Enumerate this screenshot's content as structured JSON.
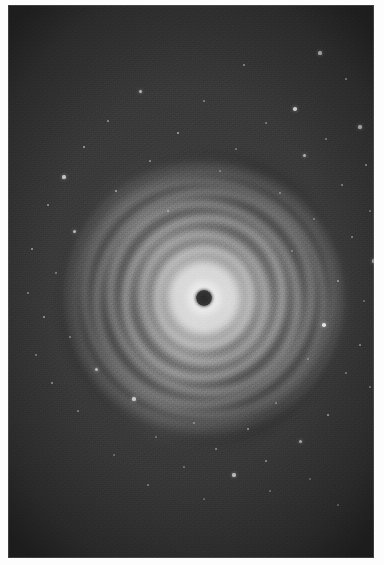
{
  "image": {
    "domain": "natural-image",
    "subject": "protoplanetary-disk",
    "title": "Concentric ringed protoplanetary disk",
    "caption": "Face-on circumstellar disk showing multiple bright concentric rings separated by dark gaps, with a dark obscured core, set against a grainy star field.",
    "alt_text": "Grayscale astronomical photograph of a ringed disk around a dark center",
    "orientation": "portrait",
    "render_mode": "grayscale"
  },
  "canvas": {
    "width": 384,
    "height": 565,
    "paper_color": "#fdfdfd",
    "margin_left": 8,
    "margin_top": 5,
    "margin_right": 10,
    "margin_bottom": 7
  },
  "plate": {
    "x": 8,
    "y": 5,
    "width": 366,
    "height": 553,
    "background_color": "#3a3a3a",
    "grain": "heavy",
    "vignette": "true"
  },
  "disk": {
    "center_x": 196,
    "center_y": 293,
    "outer_radius_x": 134,
    "outer_radius_y": 138,
    "core_color": "#2e2e2e",
    "core_radius": 8,
    "bright_halo_radius": 58,
    "ring_count": 9,
    "brightest_color": "#f2f2f2",
    "gap_color": "#5a5a5a",
    "rings": [
      {
        "label": "ring-1-inner-bright",
        "rx": 34,
        "ry": 35,
        "thickness": 13,
        "brightness": 0.95,
        "rotation": -8
      },
      {
        "label": "ring-2",
        "rx": 50,
        "ry": 52,
        "thickness": 10,
        "brightness": 0.82,
        "rotation": 14
      },
      {
        "label": "ring-3",
        "rx": 65,
        "ry": 68,
        "thickness": 11,
        "brightness": 0.7,
        "rotation": -22
      },
      {
        "label": "ring-4",
        "rx": 81,
        "ry": 84,
        "thickness": 10,
        "brightness": 0.6,
        "rotation": 30
      },
      {
        "label": "ring-5",
        "rx": 95,
        "ry": 99,
        "thickness": 9,
        "brightness": 0.5,
        "rotation": -40
      },
      {
        "label": "ring-6",
        "rx": 108,
        "ry": 112,
        "thickness": 9,
        "brightness": 0.42,
        "rotation": 52
      },
      {
        "label": "ring-7",
        "rx": 119,
        "ry": 123,
        "thickness": 8,
        "brightness": 0.33,
        "rotation": -64
      },
      {
        "label": "ring-8",
        "rx": 128,
        "ry": 132,
        "thickness": 7,
        "brightness": 0.24,
        "rotation": 76
      },
      {
        "label": "ring-9-outer-faint",
        "rx": 135,
        "ry": 139,
        "thickness": 6,
        "brightness": 0.15,
        "rotation": -88
      }
    ]
  },
  "starfield": {
    "star_color": "#f4f4f4",
    "count": 62,
    "stars": [
      {
        "x": 312,
        "y": 48,
        "r": 1.6,
        "b": 0.75
      },
      {
        "x": 236,
        "y": 60,
        "r": 1.1,
        "b": 0.55
      },
      {
        "x": 338,
        "y": 74,
        "r": 1.3,
        "b": 0.6
      },
      {
        "x": 132,
        "y": 86,
        "r": 1.5,
        "b": 0.7
      },
      {
        "x": 196,
        "y": 96,
        "r": 1.0,
        "b": 0.45
      },
      {
        "x": 287,
        "y": 104,
        "r": 1.8,
        "b": 0.85
      },
      {
        "x": 100,
        "y": 116,
        "r": 1.2,
        "b": 0.55
      },
      {
        "x": 258,
        "y": 118,
        "r": 1.0,
        "b": 0.42
      },
      {
        "x": 352,
        "y": 122,
        "r": 1.6,
        "b": 0.72
      },
      {
        "x": 170,
        "y": 128,
        "r": 1.4,
        "b": 0.62
      },
      {
        "x": 318,
        "y": 134,
        "r": 1.1,
        "b": 0.5
      },
      {
        "x": 76,
        "y": 142,
        "r": 1.3,
        "b": 0.58
      },
      {
        "x": 228,
        "y": 144,
        "r": 1.0,
        "b": 0.4
      },
      {
        "x": 296,
        "y": 150,
        "r": 1.5,
        "b": 0.66
      },
      {
        "x": 142,
        "y": 156,
        "r": 1.2,
        "b": 0.52
      },
      {
        "x": 358,
        "y": 160,
        "r": 1.3,
        "b": 0.58
      },
      {
        "x": 56,
        "y": 172,
        "r": 1.6,
        "b": 0.74
      },
      {
        "x": 212,
        "y": 166,
        "r": 1.0,
        "b": 0.38
      },
      {
        "x": 334,
        "y": 180,
        "r": 1.2,
        "b": 0.52
      },
      {
        "x": 108,
        "y": 186,
        "r": 1.4,
        "b": 0.6
      },
      {
        "x": 272,
        "y": 188,
        "r": 1.0,
        "b": 0.4
      },
      {
        "x": 40,
        "y": 200,
        "r": 1.3,
        "b": 0.56
      },
      {
        "x": 362,
        "y": 206,
        "r": 1.1,
        "b": 0.46
      },
      {
        "x": 160,
        "y": 206,
        "r": 1.2,
        "b": 0.48
      },
      {
        "x": 306,
        "y": 214,
        "r": 1.0,
        "b": 0.38
      },
      {
        "x": 66,
        "y": 226,
        "r": 1.5,
        "b": 0.68
      },
      {
        "x": 344,
        "y": 232,
        "r": 1.2,
        "b": 0.5
      },
      {
        "x": 24,
        "y": 244,
        "r": 1.4,
        "b": 0.62
      },
      {
        "x": 284,
        "y": 246,
        "r": 1.0,
        "b": 0.36
      },
      {
        "x": 366,
        "y": 256,
        "r": 1.6,
        "b": 0.7
      },
      {
        "x": 48,
        "y": 268,
        "r": 1.1,
        "b": 0.44
      },
      {
        "x": 330,
        "y": 276,
        "r": 1.3,
        "b": 0.54
      },
      {
        "x": 20,
        "y": 288,
        "r": 1.2,
        "b": 0.48
      },
      {
        "x": 356,
        "y": 296,
        "r": 1.0,
        "b": 0.38
      },
      {
        "x": 36,
        "y": 312,
        "r": 1.4,
        "b": 0.6
      },
      {
        "x": 316,
        "y": 320,
        "r": 1.8,
        "b": 0.88
      },
      {
        "x": 62,
        "y": 332,
        "r": 1.1,
        "b": 0.42
      },
      {
        "x": 352,
        "y": 340,
        "r": 1.3,
        "b": 0.56
      },
      {
        "x": 28,
        "y": 350,
        "r": 1.2,
        "b": 0.46
      },
      {
        "x": 300,
        "y": 354,
        "r": 1.0,
        "b": 0.36
      },
      {
        "x": 88,
        "y": 364,
        "r": 1.5,
        "b": 0.66
      },
      {
        "x": 338,
        "y": 368,
        "r": 1.1,
        "b": 0.44
      },
      {
        "x": 44,
        "y": 378,
        "r": 1.3,
        "b": 0.54
      },
      {
        "x": 362,
        "y": 382,
        "r": 1.2,
        "b": 0.48
      },
      {
        "x": 126,
        "y": 394,
        "r": 1.6,
        "b": 0.74
      },
      {
        "x": 268,
        "y": 398,
        "r": 1.0,
        "b": 0.38
      },
      {
        "x": 70,
        "y": 406,
        "r": 1.2,
        "b": 0.46
      },
      {
        "x": 320,
        "y": 410,
        "r": 1.4,
        "b": 0.6
      },
      {
        "x": 186,
        "y": 418,
        "r": 1.1,
        "b": 0.42
      },
      {
        "x": 240,
        "y": 424,
        "r": 1.3,
        "b": 0.56
      },
      {
        "x": 148,
        "y": 432,
        "r": 1.0,
        "b": 0.36
      },
      {
        "x": 292,
        "y": 436,
        "r": 1.5,
        "b": 0.64
      },
      {
        "x": 208,
        "y": 444,
        "r": 1.2,
        "b": 0.48
      },
      {
        "x": 106,
        "y": 450,
        "r": 1.0,
        "b": 0.34
      },
      {
        "x": 258,
        "y": 456,
        "r": 1.3,
        "b": 0.54
      },
      {
        "x": 176,
        "y": 462,
        "r": 1.1,
        "b": 0.4
      },
      {
        "x": 226,
        "y": 470,
        "r": 1.6,
        "b": 0.7
      },
      {
        "x": 302,
        "y": 474,
        "r": 1.0,
        "b": 0.34
      },
      {
        "x": 140,
        "y": 480,
        "r": 1.2,
        "b": 0.44
      },
      {
        "x": 262,
        "y": 486,
        "r": 1.1,
        "b": 0.38
      },
      {
        "x": 196,
        "y": 494,
        "r": 1.0,
        "b": 0.32
      },
      {
        "x": 330,
        "y": 500,
        "r": 1.2,
        "b": 0.42
      }
    ]
  }
}
